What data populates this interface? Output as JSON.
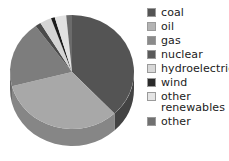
{
  "chart_data": {
    "type": "pie",
    "title": "",
    "legend_position": "right",
    "three_d": true,
    "categories": [
      "coal",
      "oil",
      "gas",
      "nuclear",
      "hydroelectric",
      "wind",
      "other renewables",
      "other"
    ],
    "values": [
      38,
      33,
      19,
      1.5,
      3,
      1,
      3,
      1.5
    ],
    "unit": "%",
    "colors": [
      "#545454",
      "#a8a8a8",
      "#7d7d7d",
      "#4a4a4a",
      "#d4d4d4",
      "#1c1c1c",
      "#e2e2e2",
      "#6b6b6b"
    ],
    "slices": [
      {
        "label": "coal",
        "value": 38,
        "color": "#545454",
        "start_angle": 0,
        "end_angle": 136.8
      },
      {
        "label": "oil",
        "value": 33,
        "color": "#a8a8a8",
        "start_angle": 136.8,
        "end_angle": 255.6
      },
      {
        "label": "gas",
        "value": 19,
        "color": "#7d7d7d",
        "start_angle": 255.6,
        "end_angle": 324.0
      },
      {
        "label": "nuclear",
        "value": 1.5,
        "color": "#4a4a4a",
        "start_angle": 324.0,
        "end_angle": 329.4
      },
      {
        "label": "hydroelectric",
        "value": 3,
        "color": "#d4d4d4",
        "start_angle": 329.4,
        "end_angle": 340.2
      },
      {
        "label": "wind",
        "value": 1,
        "color": "#1c1c1c",
        "start_angle": 340.2,
        "end_angle": 343.8
      },
      {
        "label": "other renewables",
        "value": 3,
        "color": "#e2e2e2",
        "start_angle": 343.8,
        "end_angle": 354.6
      },
      {
        "label": "other",
        "value": 1.5,
        "color": "#6b6b6b",
        "start_angle": 354.6,
        "end_angle": 360.0
      }
    ]
  },
  "legend": {
    "items": [
      {
        "label": "coal",
        "color": "#545454"
      },
      {
        "label": "oil",
        "color": "#b3b3b3"
      },
      {
        "label": "gas",
        "color": "#8a8a8a"
      },
      {
        "label": "nuclear",
        "color": "#5a5a5a"
      },
      {
        "label": "hydroelectric",
        "color": "#d8d8d8"
      },
      {
        "label": "wind",
        "color": "#2a2a2a"
      },
      {
        "label": "other\nrenewables",
        "color": "#e4e4e4"
      },
      {
        "label": "other",
        "color": "#707070"
      }
    ]
  }
}
